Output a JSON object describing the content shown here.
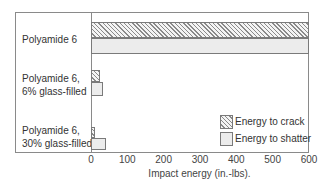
{
  "chart_data": {
    "type": "bar",
    "orientation": "horizontal",
    "title": "",
    "xlabel": "Impact energy (in.-lbs).",
    "ylabel": "",
    "xlim": [
      0,
      600
    ],
    "xticks": [
      "0",
      "100",
      "200",
      "300",
      "400",
      "500",
      "600"
    ],
    "grid": false,
    "legend_position": "lower right (inside)",
    "categories": [
      "Polyamide 6",
      "Polyamide 6, 6% glass-filled",
      "Polyamide 6, 30% glass-filled"
    ],
    "category_labels": [
      [
        "Polyamide 6"
      ],
      [
        "Polyamide 6,",
        "6% glass-filled"
      ],
      [
        "Polyamide 6,",
        "30% glass-filled"
      ]
    ],
    "series": [
      {
        "name": "Energy to crack",
        "pattern": "hatched",
        "values": [
          600,
          25,
          12
        ]
      },
      {
        "name": "Energy to shatter",
        "pattern": "light gray fill",
        "values": [
          600,
          33,
          40
        ]
      }
    ]
  },
  "colors": {
    "axis": "#8a8a8a",
    "hatch": "#8a8a8a",
    "shatter_fill": "#ececec"
  }
}
